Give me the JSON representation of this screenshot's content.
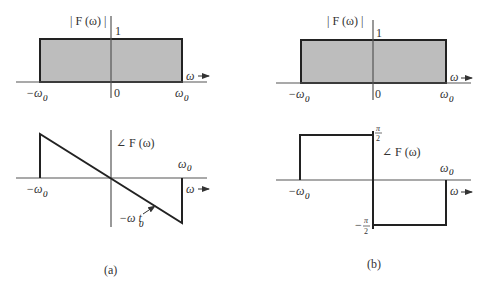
{
  "figure": {
    "panel_a": {
      "caption": "(a)",
      "magnitude": {
        "ylabel": "| F (ω) |",
        "xlabel": "ω",
        "level_label": "1",
        "origin_label": "0",
        "left_label": "−ω",
        "left_sub": "0",
        "right_label": "ω",
        "right_sub": "0",
        "fill_color": "#bdbdbd"
      },
      "phase": {
        "ylabel": "∠ F (ω)",
        "xlabel": "ω",
        "left_label": "−ω",
        "left_sub": "0",
        "right_label": "ω",
        "right_sub": "0",
        "slope_label": "−ω t",
        "slope_sub": "0"
      }
    },
    "panel_b": {
      "caption": "(b)",
      "magnitude": {
        "ylabel": "| F (ω) |",
        "xlabel": "ω",
        "level_label": "1",
        "origin_label": "0",
        "left_label": "−ω",
        "left_sub": "0",
        "right_label": "ω",
        "right_sub": "0",
        "fill_color": "#bdbdbd"
      },
      "phase": {
        "ylabel": "∠ F (ω)",
        "xlabel": "ω",
        "left_label": "−ω",
        "left_sub": "0",
        "right_label": "ω",
        "right_sub": "0",
        "top_num": "π",
        "top_den": "2",
        "bottom_sign": "−",
        "bottom_num": "π",
        "bottom_den": "2"
      }
    }
  }
}
